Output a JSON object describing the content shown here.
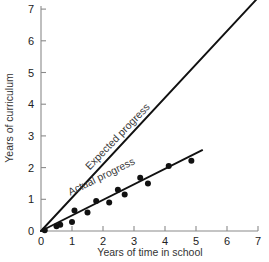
{
  "chart_data": {
    "type": "scatter",
    "title": "",
    "xlabel": "Years of time in school",
    "ylabel": "Years of curriculum",
    "xlim": [
      0,
      7.4
    ],
    "ylim": [
      0,
      7.4
    ],
    "xticks": [
      0,
      1,
      2,
      3,
      4,
      5,
      6,
      7
    ],
    "xtick_labels": [
      "0",
      "1",
      "2",
      "3",
      "4",
      "5",
      "6",
      "7"
    ],
    "yticks": [
      0,
      1,
      2,
      3,
      4,
      5,
      6,
      7
    ],
    "ytick_labels": [
      "0",
      "1",
      "2",
      "3",
      "4",
      "5",
      "6",
      "7"
    ],
    "grid": false,
    "legend_position": "inline-annotation",
    "series": [
      {
        "name": "Expected progress",
        "type": "line",
        "label": "Expected progress",
        "label_x": 2.55,
        "label_y": 2.9,
        "label_rotation": -46,
        "color": "#111111",
        "x": [
          0,
          7.02
        ],
        "y": [
          0,
          7.38
        ]
      },
      {
        "name": "Actual progress",
        "type": "line",
        "label": "Actual progress",
        "label_x": 2.0,
        "label_y": 1.62,
        "label_rotation": -26,
        "color": "#111111",
        "x": [
          0,
          5.2
        ],
        "y": [
          0,
          2.55
        ]
      },
      {
        "name": "Observed data points",
        "type": "scatter",
        "color": "#111111",
        "points": [
          {
            "x": 0.12,
            "y": 0.02
          },
          {
            "x": 0.5,
            "y": 0.15
          },
          {
            "x": 0.62,
            "y": 0.2
          },
          {
            "x": 1.0,
            "y": 0.28
          },
          {
            "x": 1.08,
            "y": 0.65
          },
          {
            "x": 1.5,
            "y": 0.58
          },
          {
            "x": 1.78,
            "y": 0.95
          },
          {
            "x": 2.2,
            "y": 0.9
          },
          {
            "x": 2.48,
            "y": 1.3
          },
          {
            "x": 2.7,
            "y": 1.15
          },
          {
            "x": 3.2,
            "y": 1.68
          },
          {
            "x": 3.45,
            "y": 1.5
          },
          {
            "x": 4.12,
            "y": 2.05
          },
          {
            "x": 4.85,
            "y": 2.22
          }
        ]
      }
    ]
  },
  "axes": {
    "x_axis_label": "Years of time in school",
    "y_axis_label": "Years of curriculum"
  }
}
